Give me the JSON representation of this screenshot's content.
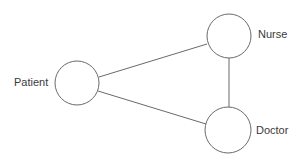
{
  "diagram": {
    "type": "undirected-graph",
    "nodes": [
      {
        "id": "patient",
        "label": "Patient",
        "cx": 77,
        "cy": 83,
        "r": 22,
        "label_x": 14,
        "label_y": 83
      },
      {
        "id": "nurse",
        "label": "Nurse",
        "cx": 229,
        "cy": 36,
        "r": 22,
        "label_x": 258,
        "label_y": 35
      },
      {
        "id": "doctor",
        "label": "Doctor",
        "cx": 228,
        "cy": 130,
        "r": 23,
        "label_x": 256,
        "label_y": 131
      }
    ],
    "edges": [
      {
        "from": "patient",
        "to": "nurse",
        "x1": 99,
        "y1": 77,
        "x2": 207,
        "y2": 44
      },
      {
        "from": "patient",
        "to": "doctor",
        "x1": 98,
        "y1": 91,
        "x2": 206,
        "y2": 124
      },
      {
        "from": "nurse",
        "to": "doctor",
        "x1": 229,
        "y1": 58,
        "x2": 229,
        "y2": 107
      }
    ],
    "colors": {
      "stroke": "#6a6a6a",
      "text": "#3a3a3a",
      "background": "#ffffff"
    }
  }
}
